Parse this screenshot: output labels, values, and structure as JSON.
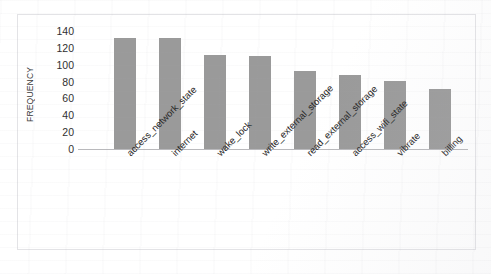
{
  "figure": {
    "background_color": "#ffffff",
    "border_color": "#e3e3e6",
    "bar_color": "#9a9a9a",
    "axis_color": "#b9b9bc"
  },
  "chart_data": {
    "type": "bar",
    "title": "",
    "xlabel": "",
    "ylabel": "FREQUENCY",
    "categories": [
      "access_network_state",
      "internet",
      "wake_lock",
      "write_external_storage",
      "read_external_storage",
      "access_wifi_state",
      "vibrate",
      "billing"
    ],
    "values": [
      132,
      132,
      112,
      110,
      92,
      88,
      81,
      71
    ],
    "ylim": [
      0,
      140
    ],
    "ytick_values": [
      0,
      20,
      40,
      60,
      80,
      100,
      120,
      140
    ],
    "ytick_labels": [
      "0",
      "20",
      "40",
      "60",
      "80",
      "100",
      "120",
      "140"
    ],
    "grid": false,
    "legend": null,
    "xtick_rotation": -45,
    "series": [
      {
        "name": "frequency",
        "values": [
          132,
          132,
          112,
          110,
          92,
          88,
          81,
          71
        ]
      }
    ]
  }
}
